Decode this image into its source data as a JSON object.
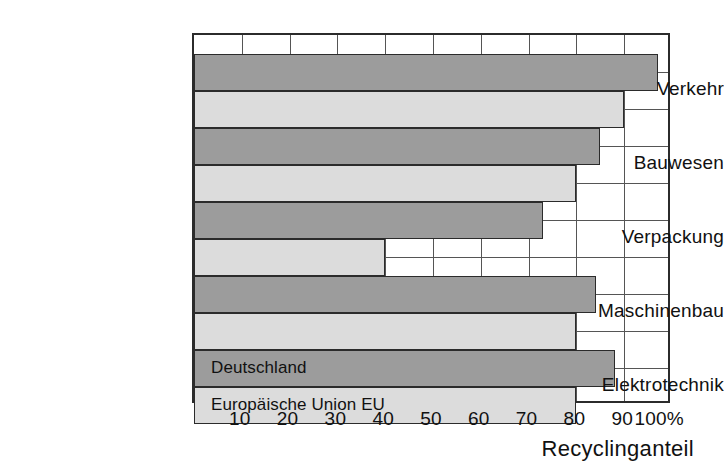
{
  "chart_data": {
    "type": "bar",
    "orientation": "horizontal",
    "title": "",
    "xlabel": "Recyclinganteil",
    "ylabel": "",
    "xlim": [
      0,
      100
    ],
    "xunit": "%",
    "grid": true,
    "legend_position": "inside-bottom-bars",
    "xticks": [
      "10",
      "20",
      "30",
      "40",
      "50",
      "60",
      "70",
      "80",
      "90",
      "100%"
    ],
    "xtick_values": [
      10,
      20,
      30,
      40,
      50,
      60,
      70,
      80,
      90,
      100
    ],
    "categories": [
      "Verkehr",
      "Bauwesen",
      "Verpackung",
      "Maschinenbau",
      "Elektrotechnik"
    ],
    "series": [
      {
        "name": "Deutschland",
        "color": "#9c9c9c",
        "values": [
          97,
          85,
          73,
          84,
          88
        ]
      },
      {
        "name": "Europäische Union EU",
        "color": "#dcdcdc",
        "values": [
          90,
          80,
          40,
          80,
          80
        ]
      }
    ]
  },
  "legend": {
    "deutschland_label": "Deutschland",
    "eu_label": "Europäische Union EU"
  },
  "axis": {
    "x_title": "Recyclinganteil"
  },
  "colors": {
    "series_deutschland": "#9c9c9c",
    "series_eu": "#dcdcdc",
    "frame": "#2b2b2b",
    "grid": "#555555",
    "background": "#ffffff"
  }
}
